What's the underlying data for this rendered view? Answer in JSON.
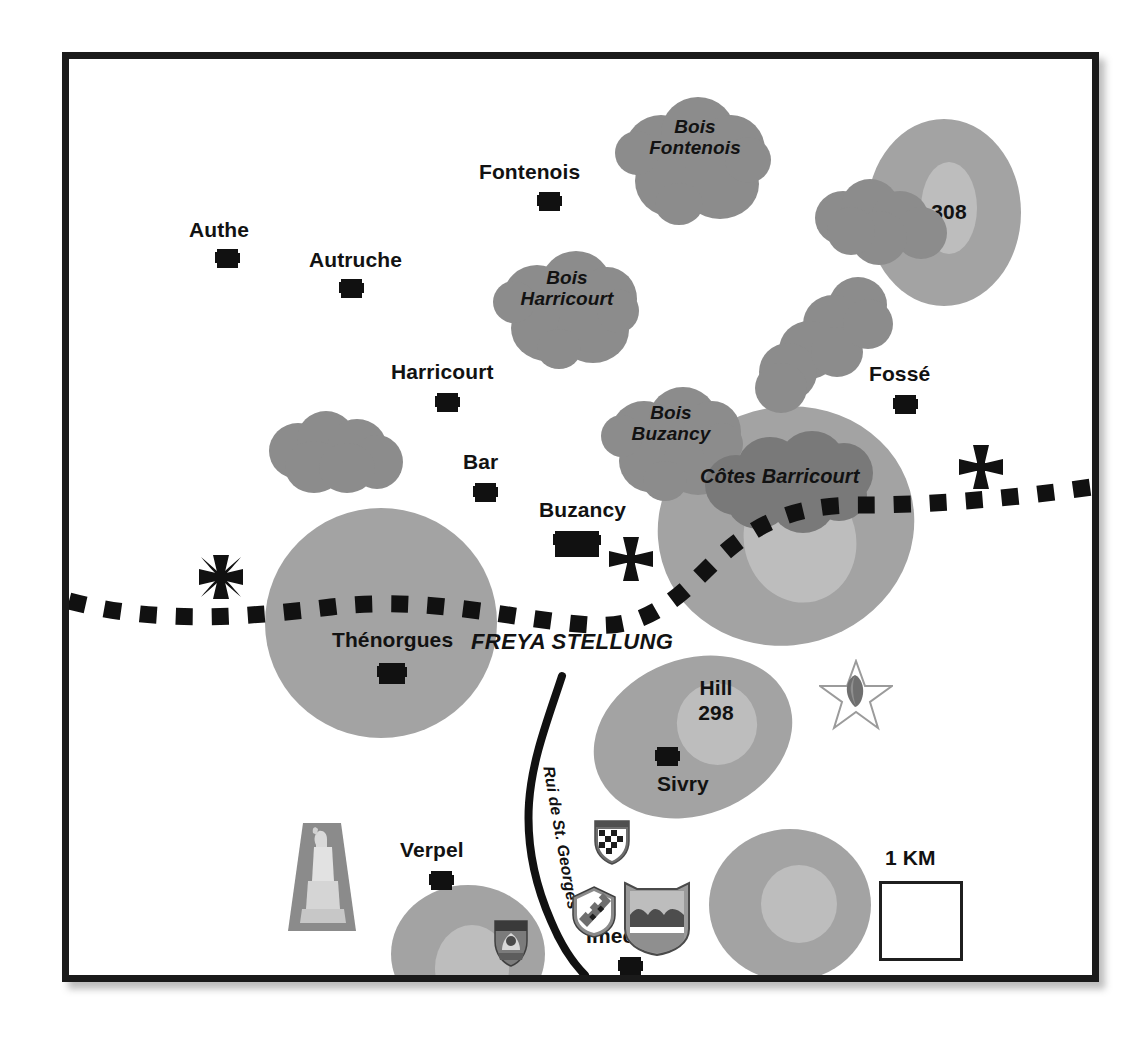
{
  "map": {
    "title": "Freya Stellung sector map",
    "front_line_label": "FREYA STELLUNG",
    "scale_label": "1 KM",
    "stream_label": "Rui de St. Georges"
  },
  "towns": [
    {
      "name": "Authe",
      "label": "Authe"
    },
    {
      "name": "Autruche",
      "label": "Autruche"
    },
    {
      "name": "Fontenois",
      "label": "Fontenois"
    },
    {
      "name": "Harricourt",
      "label": "Harricourt"
    },
    {
      "name": "Bar",
      "label": "Bar"
    },
    {
      "name": "Buzancy",
      "label": "Buzancy"
    },
    {
      "name": "Fosse",
      "label": "Fossé"
    },
    {
      "name": "Thenorgues",
      "label": "Thénorgues"
    },
    {
      "name": "Sivry",
      "label": "Sivry"
    },
    {
      "name": "Verpel",
      "label": "Verpel"
    },
    {
      "name": "Imecourt",
      "label": "Imecourt"
    }
  ],
  "woods": [
    {
      "name": "bois-fontenois",
      "label": "Bois\nFontenois"
    },
    {
      "name": "bois-harricourt",
      "label": "Bois\nHarricourt"
    },
    {
      "name": "bois-buzancy",
      "label": "Bois\nBuzancy"
    },
    {
      "name": "woods-unnamed-west",
      "label": ""
    },
    {
      "name": "woods-unnamed-north",
      "label": ""
    },
    {
      "name": "woods-unnamed-east",
      "label": ""
    },
    {
      "name": "woods-cotes-barricourt",
      "label": ""
    }
  ],
  "hills": [
    {
      "name": "hill-308",
      "label": "308"
    },
    {
      "name": "cotes-barricourt",
      "label": "Côtes Barricourt"
    },
    {
      "name": "hill-298",
      "label": "Hill\n298"
    },
    {
      "name": "hill-thenorgues",
      "label": ""
    },
    {
      "name": "hill-imecourt-east",
      "label": ""
    },
    {
      "name": "hill-verpel-south",
      "label": ""
    }
  ],
  "symbols": [
    {
      "name": "iron-cross-west",
      "type": "iron-cross"
    },
    {
      "name": "iron-cross-center",
      "type": "iron-cross"
    },
    {
      "name": "iron-cross-east",
      "type": "iron-cross"
    },
    {
      "name": "division-star",
      "type": "star-insignia"
    },
    {
      "name": "regiment-insignia-sivry",
      "type": "shield-crest"
    },
    {
      "name": "regiment-insignia-verpel",
      "type": "shield-crest"
    },
    {
      "name": "regiment-insignia-center",
      "type": "shield-crest"
    },
    {
      "name": "regiment-insignia-imecourt",
      "type": "shield-banner"
    },
    {
      "name": "monument-photo",
      "type": "monument"
    }
  ],
  "colors": {
    "woods": "#8c8c8c",
    "hill": "#a3a3a3",
    "hill_inner": "#bdbdbd",
    "ink": "#111111",
    "border": "#1a1a1a",
    "paper": "#ffffff"
  }
}
